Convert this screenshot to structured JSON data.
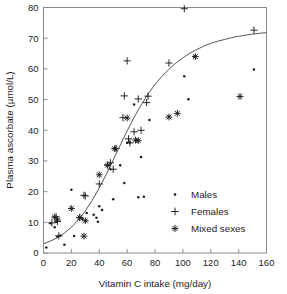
{
  "chart_data": {
    "type": "scatter",
    "title": "",
    "xlabel": "Vitamin C intake (mg/day)",
    "ylabel": "Plasma ascorbate (µmol/L)",
    "xlim": [
      0,
      160
    ],
    "ylim": [
      0,
      80
    ],
    "xticks": [
      0,
      20,
      40,
      60,
      80,
      100,
      120,
      140,
      160
    ],
    "yticks": [
      0,
      10,
      20,
      30,
      40,
      50,
      60,
      70,
      80
    ],
    "xtick_labels": [
      "0",
      "20",
      "40",
      "60",
      "80",
      "100",
      "120",
      "140",
      "160"
    ],
    "ytick_labels": [
      "0",
      "10",
      "20",
      "30",
      "40",
      "50",
      "60",
      "70",
      "80"
    ],
    "grid": false,
    "legend_position": "lower-right",
    "series": [
      {
        "name": "Males",
        "marker": "dot",
        "points": [
          [
            2,
            1.8
          ],
          [
            5,
            9.7
          ],
          [
            8,
            8.4
          ],
          [
            9,
            10.2
          ],
          [
            10,
            5.3
          ],
          [
            12,
            5.6
          ],
          [
            15,
            2.7
          ],
          [
            20,
            20.6
          ],
          [
            22,
            5.5
          ],
          [
            26,
            11.4
          ],
          [
            28,
            11.2
          ],
          [
            30,
            10.4
          ],
          [
            31,
            13.0
          ],
          [
            36,
            12.5
          ],
          [
            38,
            11.5
          ],
          [
            39,
            10.2
          ],
          [
            40,
            15.2
          ],
          [
            42,
            14.0
          ],
          [
            46,
            28.6
          ],
          [
            48,
            27.3
          ],
          [
            50,
            17.5
          ],
          [
            52,
            34.0
          ],
          [
            55,
            28.6
          ],
          [
            58,
            22.8
          ],
          [
            60,
            35.9
          ],
          [
            62,
            36.0
          ],
          [
            65,
            48.4
          ],
          [
            67,
            36.8
          ],
          [
            68,
            18.2
          ],
          [
            70,
            31.3
          ],
          [
            72,
            18.3
          ],
          [
            76,
            43.3
          ],
          [
            90,
            44.4
          ],
          [
            101,
            57.6
          ],
          [
            104,
            50.1
          ],
          [
            108,
            64.0
          ],
          [
            151,
            59.8
          ]
        ]
      },
      {
        "name": "Females",
        "marker": "plus",
        "points": [
          [
            6,
            9.8
          ],
          [
            9,
            11.8
          ],
          [
            10,
            10.3
          ],
          [
            11,
            5.6
          ],
          [
            26,
            11.6
          ],
          [
            29,
            18.8
          ],
          [
            30,
            18.6
          ],
          [
            40,
            22.5
          ],
          [
            46,
            28.7
          ],
          [
            48,
            29.4
          ],
          [
            50,
            27.3
          ],
          [
            52,
            34.1
          ],
          [
            57,
            44.1
          ],
          [
            58,
            51.2
          ],
          [
            60,
            62.6
          ],
          [
            61,
            37.2
          ],
          [
            62,
            35.9
          ],
          [
            65,
            39.5
          ],
          [
            68,
            50.2
          ],
          [
            70,
            40.0
          ],
          [
            74,
            49.0
          ],
          [
            75,
            51.1
          ],
          [
            90,
            61.9
          ],
          [
            101,
            79.6
          ],
          [
            151,
            72.6
          ]
        ]
      },
      {
        "name": "Mixed sexes",
        "marker": "asterisk",
        "points": [
          [
            8,
            11.7
          ],
          [
            10,
            10.8
          ],
          [
            20,
            14.5
          ],
          [
            26,
            11.5
          ],
          [
            29,
            5.5
          ],
          [
            30,
            10.5
          ],
          [
            40,
            25.5
          ],
          [
            46,
            28.6
          ],
          [
            51,
            34.0
          ],
          [
            60,
            44.0
          ],
          [
            66,
            36.8
          ],
          [
            68,
            36.6
          ],
          [
            90,
            44.3
          ],
          [
            96,
            45.5
          ],
          [
            109,
            64.0
          ],
          [
            141,
            51.0
          ]
        ]
      }
    ],
    "fit_curve": {
      "description": "sigmoid fitted trend line",
      "points": [
        [
          0,
          3.0
        ],
        [
          5,
          3.9
        ],
        [
          10,
          5.0
        ],
        [
          15,
          6.5
        ],
        [
          20,
          8.4
        ],
        [
          25,
          10.8
        ],
        [
          30,
          13.7
        ],
        [
          35,
          17.2
        ],
        [
          40,
          21.2
        ],
        [
          45,
          25.6
        ],
        [
          50,
          30.3
        ],
        [
          55,
          35.1
        ],
        [
          60,
          39.8
        ],
        [
          65,
          44.2
        ],
        [
          70,
          48.2
        ],
        [
          75,
          51.8
        ],
        [
          80,
          54.9
        ],
        [
          85,
          57.6
        ],
        [
          90,
          59.9
        ],
        [
          95,
          61.9
        ],
        [
          100,
          63.6
        ],
        [
          105,
          65.1
        ],
        [
          110,
          66.3
        ],
        [
          115,
          67.4
        ],
        [
          120,
          68.3
        ],
        [
          125,
          69.0
        ],
        [
          130,
          69.6
        ],
        [
          135,
          70.2
        ],
        [
          140,
          70.6
        ],
        [
          145,
          71.0
        ],
        [
          150,
          71.3
        ],
        [
          155,
          71.6
        ],
        [
          160,
          71.8
        ]
      ]
    }
  },
  "legend": {
    "entries": [
      {
        "label": "Males",
        "marker": "dot"
      },
      {
        "label": "Females",
        "marker": "plus"
      },
      {
        "label": "Mixed sexes",
        "marker": "asterisk"
      }
    ]
  },
  "colors": {
    "background": "#ffffff",
    "axis": "#8a8a8a",
    "text": "#1c1c1c",
    "curve": "#555555",
    "marker": "#1c1c1c"
  }
}
